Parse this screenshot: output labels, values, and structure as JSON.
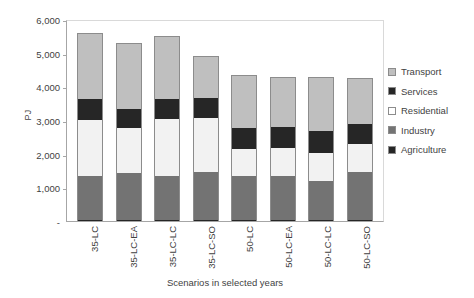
{
  "chart_data": {
    "type": "bar",
    "stacked": true,
    "title": "",
    "xlabel": "Scenarios in selected years",
    "ylabel": "PJ",
    "ylim": [
      0,
      6000
    ],
    "ytick_labels": [
      "6,000",
      "5,000",
      "4,000",
      "3,000",
      "2,000",
      "1,000",
      "-"
    ],
    "ytick_values": [
      6000,
      5000,
      4000,
      3000,
      2000,
      1000,
      0
    ],
    "grid": false,
    "legend_position": "right",
    "categories": [
      "35-LC",
      "35-LC-EA",
      "35-LC-LC",
      "35-LC-SO",
      "50-LC",
      "50-LC-EA",
      "50-LC-LC",
      "50-LC-SO"
    ],
    "series": [
      {
        "name": "Agriculture",
        "color": "#262626",
        "values": [
          20,
          20,
          20,
          20,
          20,
          20,
          20,
          20
        ]
      },
      {
        "name": "Industry",
        "color": "#737373",
        "values": [
          1330,
          1400,
          1330,
          1450,
          1330,
          1330,
          1170,
          1450
        ]
      },
      {
        "name": "Residential",
        "color": "#f2f2f2",
        "values": [
          1660,
          1330,
          1680,
          1580,
          800,
          820,
          830,
          820
        ]
      },
      {
        "name": "Services",
        "color": "#262626",
        "values": [
          620,
          580,
          600,
          610,
          620,
          610,
          650,
          600
        ]
      },
      {
        "name": "Transport",
        "color": "#bfbfbf",
        "values": [
          1970,
          1970,
          1870,
          1230,
          1580,
          1500,
          1610,
          1360
        ]
      }
    ],
    "totals": [
      5600,
      5300,
      5500,
      4890,
      4350,
      4280,
      4280,
      4230
    ]
  },
  "legend": {
    "items": [
      {
        "label": "Transport",
        "color": "#bfbfbf"
      },
      {
        "label": "Services",
        "color": "#262626"
      },
      {
        "label": "Residential",
        "color": "#ffffff"
      },
      {
        "label": "Industry",
        "color": "#737373"
      },
      {
        "label": "Agriculture",
        "color": "#262626"
      }
    ]
  }
}
